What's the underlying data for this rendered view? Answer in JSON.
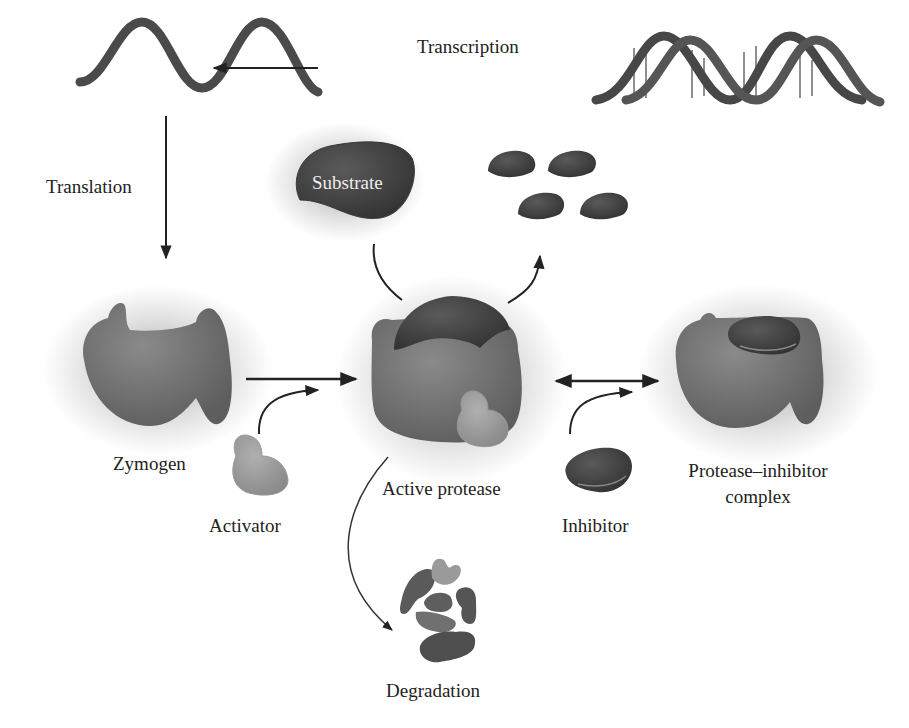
{
  "figure": {
    "nodes": {
      "dna": {
        "name": "DNA double helix"
      },
      "mrna": {
        "name": "mRNA"
      },
      "substrate": {
        "label": "Substrate"
      },
      "products": {
        "count": 4,
        "name": "Cleaved substrate fragments"
      },
      "zymogen": {
        "label": "Zymogen"
      },
      "activator": {
        "label": "Activator"
      },
      "active_protease": {
        "label": "Active protease"
      },
      "inhibitor": {
        "label": "Inhibitor"
      },
      "complex": {
        "label_line1": "Protease–inhibitor",
        "label_line2": "complex"
      },
      "degradation": {
        "label": "Degradation"
      }
    },
    "edges": [
      {
        "from": "dna",
        "to": "mrna",
        "label": "Transcription"
      },
      {
        "from": "mrna",
        "to": "zymogen",
        "label": "Translation"
      },
      {
        "from": "zymogen",
        "to": "active_protease",
        "via": "activator"
      },
      {
        "from": "active_protease",
        "to": "complex",
        "via": "inhibitor",
        "bidirectional": true
      },
      {
        "from": "substrate",
        "to": "products",
        "via": "active_protease"
      },
      {
        "from": "active_protease",
        "to": "degradation"
      }
    ],
    "colors": {
      "shape_dark": "#4a4a4a",
      "shape_mid": "#6e6e6e",
      "shape_light": "#9a9a9a",
      "arrow": "#222222",
      "background": "#ffffff"
    }
  }
}
